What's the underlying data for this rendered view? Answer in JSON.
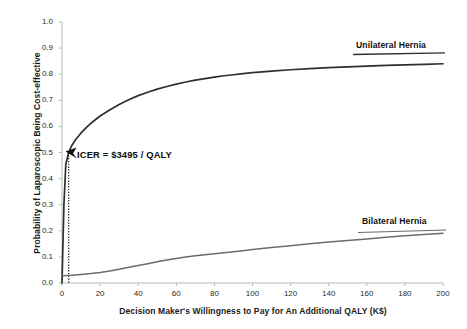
{
  "chart_data": {
    "type": "line",
    "title": "",
    "xlabel": "Decision Maker's Willingness to Pay for An Additional QALY (K$)",
    "ylabel": "Probability of Laparoscopic Being Cost-effective",
    "xlim": [
      0,
      200
    ],
    "ylim": [
      0.0,
      1.0
    ],
    "grid": false,
    "legend_position": "inline-right",
    "xticks": [
      0,
      20,
      40,
      60,
      80,
      100,
      120,
      140,
      160,
      180,
      200
    ],
    "xtick_labels": [
      "0",
      "20",
      "40",
      "60",
      "80",
      "100",
      "120",
      "140",
      "160",
      "180",
      "200"
    ],
    "yticks": [
      0.0,
      0.1,
      0.2,
      0.3,
      0.4,
      0.5,
      0.6,
      0.7,
      0.8,
      0.9,
      1.0
    ],
    "ytick_labels": [
      "0.0",
      "0.1",
      "0.2",
      "0.3",
      "0.4",
      "0.5",
      "0.6",
      "0.7",
      "0.8",
      "0.9",
      "1.0"
    ],
    "series": [
      {
        "name": "Unilateral Hernia",
        "color": "#2f2f2f",
        "x": [
          0,
          1,
          2,
          3.495,
          5,
          7,
          10,
          13,
          16,
          20,
          25,
          30,
          35,
          40,
          45,
          50,
          55,
          60,
          65,
          70,
          75,
          80,
          85,
          90,
          95,
          100,
          110,
          120,
          130,
          140,
          150,
          160,
          170,
          180,
          190,
          200
        ],
        "values": [
          0.0,
          0.3,
          0.455,
          0.5,
          0.525,
          0.548,
          0.575,
          0.597,
          0.617,
          0.64,
          0.663,
          0.684,
          0.702,
          0.718,
          0.731,
          0.743,
          0.753,
          0.762,
          0.77,
          0.777,
          0.783,
          0.789,
          0.794,
          0.798,
          0.802,
          0.806,
          0.812,
          0.817,
          0.821,
          0.825,
          0.828,
          0.831,
          0.834,
          0.836,
          0.838,
          0.84
        ]
      },
      {
        "name": "Bilateral Hernia",
        "color": "#6b6b6b",
        "x": [
          0,
          5,
          10,
          15,
          20,
          25,
          30,
          35,
          40,
          45,
          50,
          55,
          60,
          65,
          70,
          75,
          80,
          85,
          90,
          95,
          100,
          110,
          120,
          130,
          140,
          150,
          160,
          170,
          180,
          190,
          200
        ],
        "values": [
          0.028,
          0.03,
          0.033,
          0.036,
          0.04,
          0.046,
          0.053,
          0.06,
          0.067,
          0.074,
          0.081,
          0.088,
          0.094,
          0.1,
          0.104,
          0.108,
          0.112,
          0.116,
          0.12,
          0.124,
          0.128,
          0.136,
          0.143,
          0.15,
          0.157,
          0.163,
          0.169,
          0.175,
          0.181,
          0.186,
          0.191
        ]
      }
    ],
    "annotations": [
      {
        "name": "icer-threshold",
        "text": "ICER = $3495 / QALY",
        "x": 3.495,
        "y": 0.5,
        "marker": "arrow",
        "reference_line": "vertical-dotted"
      }
    ]
  },
  "labels": {
    "unilateral": "Unilateral Hernia",
    "bilateral": "Bilateral Hernia",
    "icer": "ICER = $3495 / QALY",
    "xaxis": "Decision Maker's Willingness to Pay for An Additional QALY (K$)",
    "yaxis": "Probability of Laparoscopic Being Cost-effective"
  },
  "colors": {
    "unilateral": "#2f2f2f",
    "bilateral": "#6b6b6b",
    "axis": "#b9b9b9",
    "text": "#1a1a1a"
  }
}
